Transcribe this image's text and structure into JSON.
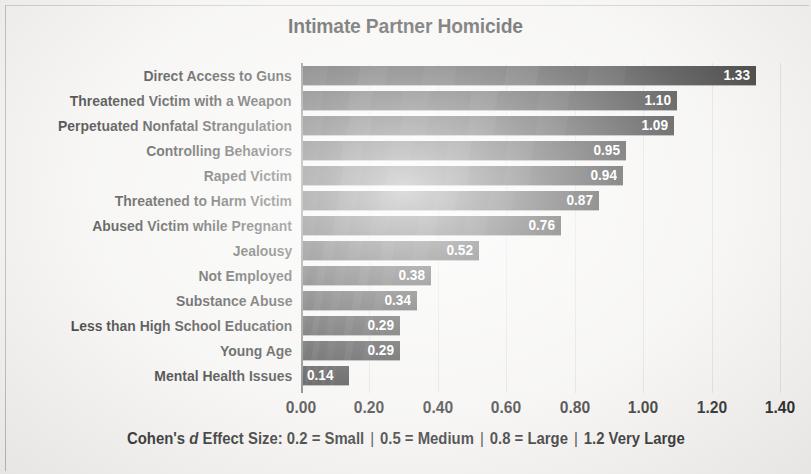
{
  "figure": {
    "title": "Intimate Partner Homicide",
    "footnote": {
      "prefix": "Cohen's",
      "italic_symbol": "d",
      "text": "Effect Size: 0.2 = Small",
      "sep": "|",
      "item2": "0.5 = Medium",
      "item3": "0.8 = Large",
      "item4": "1.2 Very Large",
      "full": "Cohen's d Effect Size: 0.2 = Small | 0.5 = Medium | 0.8 = Large | 1.2 Very Large"
    },
    "bar_color": "#161616",
    "value_label_color": "#ffffff",
    "background_color": "#f3f2f0"
  },
  "chart_data": {
    "type": "bar",
    "orientation": "horizontal",
    "title": "Intimate Partner Homicide",
    "xlabel": "",
    "ylabel": "",
    "xlim": [
      0.0,
      1.4
    ],
    "grid": true,
    "legend": null,
    "xticks": [
      "0.00",
      "0.20",
      "0.40",
      "0.60",
      "0.80",
      "1.00",
      "1.20",
      "1.40"
    ],
    "xtick_values": [
      0.0,
      0.2,
      0.4,
      0.6,
      0.8,
      1.0,
      1.2,
      1.4
    ],
    "categories": [
      "Direct Access to Guns",
      "Threatened Victim with a Weapon",
      "Perpetuated Nonfatal Strangulation",
      "Controlling Behaviors",
      "Raped Victim",
      "Threatened to Harm Victim",
      "Abused Victim while Pregnant",
      "Jealousy",
      "Not Employed",
      "Substance Abuse",
      "Less than High School Education",
      "Young Age",
      "Mental Health Issues"
    ],
    "values": [
      1.33,
      1.1,
      1.09,
      0.95,
      0.94,
      0.87,
      0.76,
      0.52,
      0.38,
      0.34,
      0.29,
      0.29,
      0.14
    ],
    "value_labels": [
      "1.33",
      "1.10",
      "1.09",
      "0.95",
      "0.94",
      "0.87",
      "0.76",
      "0.52",
      "0.38",
      "0.34",
      "0.29",
      "0.29",
      "0.14"
    ],
    "annotation": "Cohen's d Effect Size: 0.2 = Small | 0.5 = Medium | 0.8 = Large | 1.2 Very Large"
  }
}
